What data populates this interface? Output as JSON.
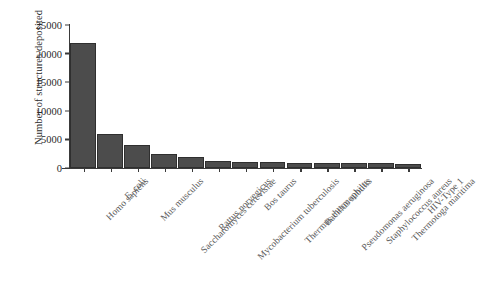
{
  "chart_data": {
    "type": "bar",
    "title": "",
    "xlabel": "",
    "ylabel": "Number of structures deposited",
    "ylim": [
      0,
      25000
    ],
    "yticks": [
      0,
      5000,
      10000,
      15000,
      20000,
      25000
    ],
    "ytick_labels": [
      "0",
      "5000",
      "10000",
      "15000",
      "20000",
      "25000"
    ],
    "grid": false,
    "legend": false,
    "bar_color": "#4c4c4c",
    "categories": [
      "Homo sapiens",
      "E. coli",
      "Mus musculus",
      "Saccharomyces cerevisiae",
      "Rattus norvegicus",
      "Mycobacterium tuberculosis",
      "Bos taurus",
      "Thermus thermophilus",
      "Bacillus subtilis",
      "Pseudomonas aeruginosa",
      "Staphylococcus aureus",
      "Thermotoga maritima",
      "HIV-Type 1"
    ],
    "values": [
      21800,
      6000,
      4000,
      2500,
      2000,
      1200,
      1100,
      1000,
      950,
      900,
      850,
      800,
      700
    ]
  }
}
